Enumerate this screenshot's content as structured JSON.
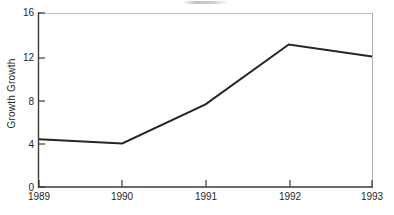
{
  "chart_data": {
    "type": "line",
    "title": "",
    "xlabel": "",
    "ylabel": "Growth Growth",
    "categories": [
      "1989",
      "1990",
      "1991",
      "1992",
      "1993"
    ],
    "x": [
      1989,
      1990,
      1991,
      1992,
      1993
    ],
    "values": [
      4.4,
      4.0,
      7.6,
      13.1,
      12.0
    ],
    "series": [
      {
        "name": "Growth Growth",
        "values": [
          4.4,
          4.0,
          7.6,
          13.1,
          12.0
        ]
      }
    ],
    "ylim": [
      0,
      16
    ],
    "xlim": [
      1989,
      1993
    ],
    "yticks": [
      0,
      4,
      8,
      12,
      16
    ],
    "ytick_labels": [
      "0",
      "4",
      "8",
      "12",
      "16"
    ],
    "xticks": [
      1989,
      1990,
      1991,
      1992,
      1993
    ],
    "xtick_labels": [
      "1989",
      "1990",
      "1991",
      "1992",
      "1993"
    ],
    "grid": false,
    "legend": "none",
    "line_color": "#262626",
    "background_color": "#ffffff"
  },
  "axes": {
    "y_title": "Growth Growth",
    "y_tick_labels": [
      "16",
      "12",
      "8",
      "4",
      "0"
    ],
    "x_tick_labels": [
      "1989",
      "1990",
      "1991",
      "1992",
      "1993"
    ]
  },
  "colors": {
    "line": "#262626",
    "axis": "#3a3a3a",
    "axis_faint": "#b9b9b9",
    "text": "#1f1f1f",
    "background": "#ffffff"
  }
}
